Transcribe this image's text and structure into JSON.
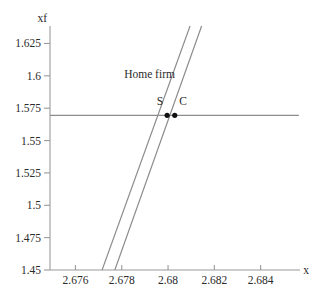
{
  "chart_data": {
    "type": "line",
    "title": "",
    "xlabel": "x",
    "ylabel": "xf",
    "xlim": [
      2.6749,
      2.6857
    ],
    "ylim": [
      1.45,
      1.6385
    ],
    "grid": false,
    "legend": "none",
    "xticks": [
      2.676,
      2.678,
      2.68,
      2.682,
      2.684
    ],
    "xtick_labels": [
      "2.676",
      "2.678",
      "2.68",
      "2.682",
      "2.684"
    ],
    "yticks": [
      1.45,
      1.475,
      1.5,
      1.525,
      1.55,
      1.575,
      1.625
    ],
    "ytick_labels": [
      "1.45",
      "1.475",
      "1.5",
      "1.525",
      "1.55",
      "1.575",
      "1.6",
      "1.625"
    ],
    "ytick_values": [
      1.45,
      1.475,
      1.5,
      1.525,
      1.55,
      1.575,
      1.6,
      1.625
    ],
    "series": [
      {
        "name": "supply-curve-S",
        "points": [
          [
            2.67715,
            1.45
          ],
          [
            2.68095,
            1.6385
          ]
        ]
      },
      {
        "name": "supply-curve-C",
        "points": [
          [
            2.6777,
            1.45
          ],
          [
            2.68145,
            1.6385
          ]
        ]
      },
      {
        "name": "horizontal-price-line",
        "points": [
          [
            2.6749,
            1.5695
          ],
          [
            2.68565,
            1.5695
          ]
        ]
      }
    ],
    "annotations": [
      {
        "name": "home-firm-label",
        "text": "Home firm",
        "x": 2.6792,
        "y": 1.5985
      },
      {
        "name": "point-label-S",
        "text": "S",
        "x": 2.67965,
        "y": 1.5775
      },
      {
        "name": "point-label-C",
        "text": "C",
        "x": 2.68065,
        "y": 1.5775
      }
    ],
    "points": [
      {
        "name": "point-S",
        "label": "S",
        "x": 2.67996,
        "y": 1.5695
      },
      {
        "name": "point-C",
        "label": "C",
        "x": 2.68029,
        "y": 1.5695
      }
    ]
  }
}
